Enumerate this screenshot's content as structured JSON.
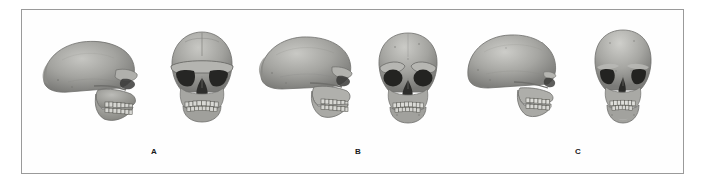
{
  "figure": {
    "background_color": "#ffffff",
    "frame_color": "#9a9a9a",
    "bone_color": "#9d9d9a",
    "bone_shadow_color": "#6f6f6c",
    "bone_highlight_color": "#c3c3bf",
    "cavity_color": "#2b2b2b",
    "label_color": "#1a1a1a",
    "groups": [
      {
        "id": "A",
        "label": "A",
        "label_x": 151,
        "label_y": 148,
        "specimens": [
          {
            "view": "lateral",
            "name": "skull-a-lateral",
            "x": 38,
            "y": 30,
            "width": 104,
            "height": 96,
            "features": "low receding forehead, heavy continuous brow ridge, long low braincase, prognathic face, no chin"
          },
          {
            "view": "frontal",
            "name": "skull-a-frontal",
            "x": 163,
            "y": 26,
            "width": 78,
            "height": 100,
            "features": "broad flat cranium, thick horizontal supraorbital torus, wide square orbits, broad nasal aperture, wide dental arcade"
          }
        ]
      },
      {
        "id": "B",
        "label": "B",
        "label_x": 355,
        "label_y": 148,
        "specimens": [
          {
            "view": "lateral",
            "name": "skull-b-lateral",
            "x": 256,
            "y": 29,
            "width": 100,
            "height": 97,
            "features": "larger rounded braincase, reduced but present brow ridge, slight occipital bun, midfacial projection"
          },
          {
            "view": "frontal",
            "name": "skull-b-frontal",
            "x": 371,
            "y": 29,
            "width": 74,
            "height": 98,
            "features": "rounded high vault, large rounded orbits, moderate brow ridges, narrower face"
          }
        ]
      },
      {
        "id": "C",
        "label": "C",
        "label_x": 575,
        "label_y": 148,
        "specimens": [
          {
            "view": "lateral",
            "name": "skull-c-lateral",
            "x": 462,
            "y": 30,
            "width": 100,
            "height": 98,
            "features": "high vertical forehead, globular braincase, minimal brow ridge, orthognathic face with chin"
          },
          {
            "view": "frontal",
            "name": "skull-c-frontal",
            "x": 587,
            "y": 27,
            "width": 72,
            "height": 100,
            "features": "tall rounded vault, smooth brow, narrow orbits, narrow nasal aperture, pointed chin"
          }
        ]
      }
    ]
  }
}
